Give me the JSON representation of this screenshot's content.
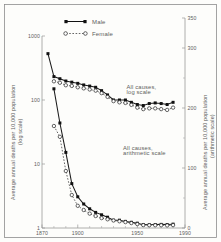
{
  "chart_data": {
    "type": "line",
    "title": "",
    "xlabel": "",
    "ylabel": "Average annual deaths per 10,000 population (log scale)",
    "y2label": "Average annual deaths per 10,000 population (arithmetic scale)",
    "x": [
      1875,
      1880,
      1885,
      1890,
      1895,
      1900,
      1905,
      1910,
      1915,
      1920,
      1925,
      1930,
      1935,
      1940,
      1945,
      1950,
      1955,
      1960,
      1965,
      1970,
      1975,
      1980
    ],
    "xlim": [
      1870,
      1990
    ],
    "xticks_major": [
      1870,
      1900,
      1950,
      1990
    ],
    "xtick_labels": [
      "1870",
      "1900",
      "1950",
      "1990"
    ],
    "xticks_minor": [
      1880,
      1890,
      1910,
      1920,
      1930,
      1940,
      1960,
      1970,
      1980
    ],
    "yscale": "log",
    "ylim": [
      1,
      1000
    ],
    "yticks": [
      1,
      10,
      100,
      1000
    ],
    "ytick_labels": [
      "1",
      "10",
      "100",
      "1000"
    ],
    "y2lim": [
      0,
      350
    ],
    "y2ticks": [
      0,
      100,
      200,
      300,
      350
    ],
    "y2tick_labels": [
      "0",
      "100",
      "200",
      "300",
      "350"
    ],
    "y2ticks_minor": [
      50,
      150,
      250
    ],
    "grid": false,
    "legend_position": "top-center",
    "annotations": [
      {
        "text": "All causes,",
        "x": 1941,
        "y": 150
      },
      {
        "text": "log scale",
        "x": 1941,
        "y": 126
      },
      {
        "text": "All causes,",
        "x": 1938,
        "y": 16.5
      },
      {
        "text": "arithmetic scale",
        "x": 1938,
        "y": 13.8
      }
    ],
    "series": [
      {
        "name": "Male",
        "marker": "filled-square",
        "linestyle": "solid",
        "color": "#111111",
        "groups": [
          {
            "label": "All causes, log scale",
            "values": [
              530,
              232,
              215,
              198,
              190,
              182,
              172,
              165,
              158,
              140,
              120,
              100,
              100,
              100,
              92,
              85,
              82,
              88,
              90,
              88,
              85,
              92
            ]
          },
          {
            "label": "All causes, arithmetic scale",
            "values": [
              null,
              232,
              175,
              126,
              74,
              52,
              40,
              32,
              26,
              22,
              18,
              13,
              13,
              11,
              9.5,
              8.0,
              5.6,
              5.5,
              5.8,
              6.0,
              5.7,
              6.4
            ]
          }
        ]
      },
      {
        "name": "Female",
        "marker": "open-circle",
        "linestyle": "dotted",
        "color": "#333333",
        "groups": [
          {
            "label": "All causes, log scale",
            "values": [
              null,
              196,
              186,
              170,
              166,
              158,
              152,
              146,
              140,
              128,
              112,
              96,
              92,
              90,
              84,
              76,
              72,
              74,
              74,
              72,
              70,
              76
            ]
          },
          {
            "label": "All causes, arithmetic scale",
            "values": [
              null,
              170,
              152,
              95,
              55,
              37,
              30,
              24,
              20,
              16.5,
              14.5,
              12.5,
              11.2,
              9.8,
              8.2,
              6.5,
              4.8,
              4.6,
              4.6,
              4.6,
              4.3,
              4.8
            ]
          }
        ]
      }
    ]
  },
  "legend": {
    "items": [
      {
        "label": "Male",
        "marker": "filled-square",
        "linestyle": "solid"
      },
      {
        "label": "Female",
        "marker": "open-circle",
        "linestyle": "dotted"
      }
    ]
  }
}
